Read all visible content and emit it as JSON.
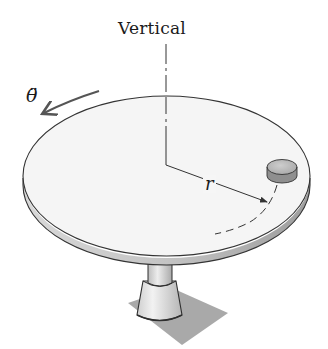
{
  "figure": {
    "type": "rotating-disc-diagram",
    "labels": {
      "vertical_axis": "Vertical",
      "angular_acceleration": "θ̈",
      "radius": "r"
    },
    "elements": [
      "turntable-disc",
      "vertical-axis",
      "radius-line",
      "small-block",
      "circular-path",
      "rotation-arrow",
      "pedestal",
      "base-plate"
    ],
    "colors": {
      "disc_top": "#f4f4f4",
      "disc_edge": "#bdbdbd",
      "outline": "#333333",
      "block": "#b9b9b9",
      "base_plate": "#a8a8a8",
      "pedestal": "#dcdcdc"
    }
  }
}
